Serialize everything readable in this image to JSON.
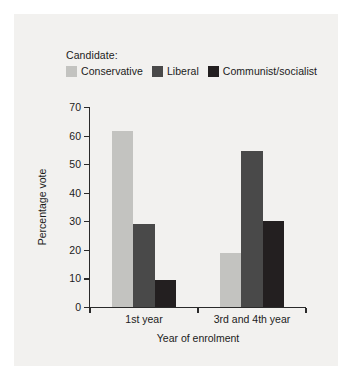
{
  "chart_data": {
    "type": "bar",
    "title": "",
    "subtitle": "",
    "xlabel": "Year of enrolment",
    "ylabel": "Percentage vote",
    "categories": [
      "1st year",
      "3rd and 4th year"
    ],
    "series": [
      {
        "name": "Conservative",
        "values": [
          61.5,
          19.0
        ],
        "color": "#c3c3c0"
      },
      {
        "name": "Liberal",
        "values": [
          29.0,
          54.5
        ],
        "color": "#494949"
      },
      {
        "name": "Communist/socialist",
        "values": [
          9.5,
          30.0
        ],
        "color": "#231f20"
      }
    ],
    "ylim": [
      0,
      70
    ],
    "yticks": [
      0,
      10,
      20,
      30,
      40,
      50,
      60,
      70
    ],
    "ytick_labels": [
      "0",
      "10",
      "20",
      "30",
      "40",
      "50",
      "60",
      "70"
    ],
    "grid": false,
    "legend_position": "top-left-above-axes",
    "legend_title": "Candidate:"
  },
  "legend": {
    "title": "Candidate:",
    "entries": [
      {
        "label": "Conservative",
        "color": "#c3c3c0"
      },
      {
        "label": "Liberal",
        "color": "#494949"
      },
      {
        "label": "Communist/socialist",
        "color": "#231f20"
      }
    ]
  },
  "figure": {
    "background_color": "#f2f1ef",
    "axis_color": "#2a2a2a",
    "text_color": "#1b1b1b"
  }
}
